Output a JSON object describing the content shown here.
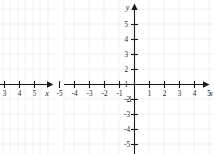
{
  "figure": {
    "background_color": "#ffffff",
    "grid_color": "#ededf0",
    "axis_color": "#1a1a1a",
    "label_color": "#1f1f1f",
    "panel_count": 2
  },
  "left_panel": {
    "name": "partial-coordinate-plane",
    "note_visible": "clipped at left edge of image",
    "x_axis_label": "x",
    "visible_x_tick_labels": [
      "3",
      "4",
      "5"
    ],
    "visible_y_tick_labels": [],
    "arrow_direction": "right"
  },
  "right_panel": {
    "name": "coordinate-plane",
    "x_axis_label": "x",
    "y_axis_label": "y",
    "x_tick_labels": [
      "-5",
      "-4",
      "-3",
      "-2",
      "-1",
      "1",
      "2",
      "3",
      "4",
      "5"
    ],
    "y_tick_labels": [
      "5",
      "4",
      "3",
      "2",
      "1",
      "-1",
      "-2",
      "-3",
      "-4",
      "-5"
    ],
    "origin_label": "",
    "arrow_directions": [
      "right",
      "up"
    ]
  },
  "chart_data": {
    "type": "scatter",
    "title": "",
    "subtitle": "",
    "xlabel": "x",
    "ylabel": "y",
    "series": [
      {
        "name": "left-partial-plane",
        "x": [],
        "y": []
      },
      {
        "name": "right-plane",
        "x": [],
        "y": []
      }
    ],
    "panels": [
      {
        "id": "left",
        "xlabel": "x",
        "ylabel": "",
        "xlim": [
          2.4,
          6.2
        ],
        "ylim": [
          -4.5,
          4.5
        ],
        "xticks": [
          3,
          4,
          5
        ],
        "yticks": [],
        "xticklabels": [
          "3",
          "4",
          "5"
        ],
        "yticklabels": [],
        "grid": true,
        "clipped": true,
        "data_points": []
      },
      {
        "id": "right",
        "xlabel": "x",
        "ylabel": "y",
        "xlim": [
          -5.6,
          5.6
        ],
        "ylim": [
          -5.6,
          5.6
        ],
        "xticks": [
          -5,
          -4,
          -3,
          -2,
          -1,
          1,
          2,
          3,
          4,
          5
        ],
        "yticks": [
          -5,
          -4,
          -3,
          -2,
          -1,
          1,
          2,
          3,
          4,
          5
        ],
        "xticklabels": [
          "-5",
          "-4",
          "-3",
          "-2",
          "-1",
          "1",
          "2",
          "3",
          "4",
          "5"
        ],
        "yticklabels": [
          "-5",
          "-4",
          "-3",
          "-2",
          "-1",
          "1",
          "2",
          "3",
          "4",
          "5"
        ],
        "grid": true,
        "clipped": false,
        "data_points": []
      }
    ],
    "legend": [],
    "legend_position": "none",
    "annotations": [],
    "gridlines": true
  }
}
